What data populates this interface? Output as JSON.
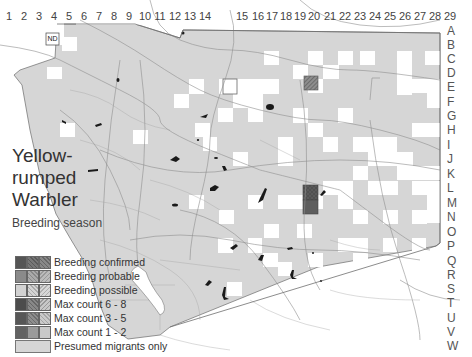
{
  "title": {
    "line1": "Yellow-",
    "line2": "rumped",
    "line3": "Warbler"
  },
  "subtitle": "Breeding season",
  "grid": {
    "columns": [
      "1",
      "2",
      "3",
      "4",
      "5",
      "6",
      "7",
      "8",
      "9",
      "10",
      "11",
      "12",
      "13",
      "14",
      "15",
      "16",
      "17",
      "18",
      "19",
      "20",
      "21",
      "22",
      "23",
      "24",
      "25",
      "26",
      "27",
      "28",
      "29"
    ],
    "rows": [
      "A",
      "B",
      "C",
      "D",
      "E",
      "F",
      "G",
      "H",
      "I",
      "J",
      "K",
      "L",
      "M",
      "N",
      "O",
      "P",
      "Q",
      "R",
      "S",
      "T",
      "U",
      "V",
      "W"
    ]
  },
  "annotations": {
    "no_data_label": "ND"
  },
  "legend": {
    "items": [
      {
        "label": "Breeding confirmed",
        "swatches": [
          "#555555",
          "#6a6a6a",
          "#7a7a7a"
        ]
      },
      {
        "label": "Breeding probable",
        "swatches": [
          "#8a8a8a",
          "#999999",
          "#aaaaaa"
        ]
      },
      {
        "label": "Breeding possible",
        "swatches": [
          "#cfcfcf",
          "#c2c2c2",
          "#d0d0d0"
        ]
      },
      {
        "label": "Max count 6 - 8",
        "swatches": [
          "#4f4f4f",
          "#777777",
          "#b5b5b5"
        ]
      },
      {
        "label": "Max count 3 - 5",
        "swatches": [
          "#5a5a5a",
          "#808080",
          "#bdbdbd"
        ]
      },
      {
        "label": "Max count 1 - 2",
        "swatches": [
          "#666666",
          "#999999",
          "#c8c8c8"
        ]
      },
      {
        "label": "Presumed migrants only",
        "swatches": [
          "#d6d6d6"
        ]
      }
    ]
  },
  "colors": {
    "presumed_migrants": "#d6d6d6",
    "breeding_confirmed": "#5c5c5c",
    "breeding_probable_hatched": "#7a7a7a",
    "water": "#1a1a1a",
    "roads": "#8c8c8c",
    "boundary": "#777777"
  },
  "highlighted_cells": [
    {
      "cell": "20E",
      "category": "Breeding probable"
    },
    {
      "cell": "20M",
      "category": "Breeding confirmed"
    },
    {
      "cell": "20N",
      "category": "Breeding confirmed"
    },
    {
      "cell": "4D",
      "category": "No data"
    }
  ]
}
